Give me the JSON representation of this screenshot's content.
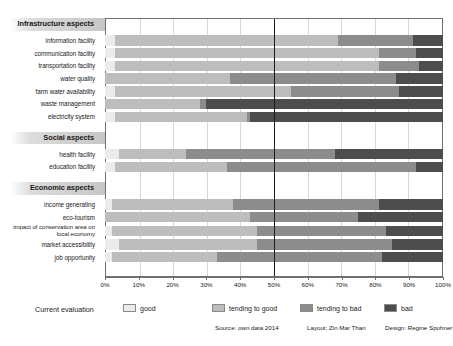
{
  "chart_data": {
    "type": "bar",
    "subtype": "stacked-horizontal-100percent",
    "title": "",
    "xlabel": "",
    "ylabel": "",
    "xlim": [
      0,
      100
    ],
    "xticks": [
      "0%",
      "10%",
      "20%",
      "30%",
      "40%",
      "50%",
      "60%",
      "70%",
      "80%",
      "90%",
      "100%"
    ],
    "grid": true,
    "legend_position": "bottom",
    "legend_title": "Current evaluation",
    "series": [
      {
        "name": "good",
        "color": "#ebebeb"
      },
      {
        "name": "tending to good",
        "color": "#bdbdbd"
      },
      {
        "name": "tending to bad",
        "color": "#8c8c8c"
      },
      {
        "name": "bad",
        "color": "#4d4d4d"
      }
    ],
    "groups": [
      {
        "label": "Infrastructure aspects",
        "rows": [
          {
            "label": "information facility",
            "values": [
              3,
              66,
              22,
              9
            ]
          },
          {
            "label": "communication facility",
            "values": [
              3,
              78,
              11,
              8
            ]
          },
          {
            "label": "transportation facility",
            "values": [
              3,
              78,
              12,
              7
            ]
          },
          {
            "label": "water quality",
            "values": [
              0,
              37,
              49,
              14
            ]
          },
          {
            "label": "farm water availability",
            "values": [
              3,
              52,
              32,
              13
            ]
          },
          {
            "label": "waste management",
            "values": [
              0,
              28,
              2,
              70
            ]
          },
          {
            "label": "electricity system",
            "values": [
              3,
              39,
              1,
              57
            ]
          }
        ]
      },
      {
        "label": "Social aspects",
        "rows": [
          {
            "label": "health facility",
            "values": [
              4,
              20,
              44,
              32
            ]
          },
          {
            "label": "education facility",
            "values": [
              3,
              33,
              56,
              8
            ]
          }
        ]
      },
      {
        "label": "Economic aspects",
        "rows": [
          {
            "label": "income generating",
            "values": [
              2,
              36,
              43,
              19
            ]
          },
          {
            "label": "eco-tourism",
            "values": [
              0,
              43,
              32,
              25
            ]
          },
          {
            "label": "impact of conservation area on local economy",
            "values": [
              2,
              43,
              38,
              17
            ]
          },
          {
            "label": "market accessibility",
            "values": [
              4,
              41,
              40,
              15
            ]
          },
          {
            "label": "job opportunity",
            "values": [
              2,
              31,
              49,
              18
            ]
          }
        ]
      }
    ]
  },
  "legend": {
    "title": "Current evaluation",
    "items": [
      {
        "label": "good",
        "color": "#ebebeb"
      },
      {
        "label": "tending to good",
        "color": "#bdbdbd"
      },
      {
        "label": "tending to bad",
        "color": "#8c8c8c"
      },
      {
        "label": "bad",
        "color": "#4d4d4d"
      }
    ]
  },
  "credits": {
    "source": "Source: own data 2014",
    "layout": "Layout: Zin Mar Than",
    "design": "Design: Regine Spohner"
  }
}
